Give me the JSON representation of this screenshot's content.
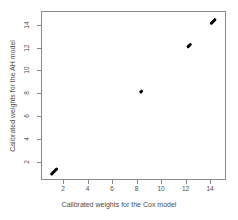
{
  "chart_data": {
    "type": "scatter",
    "title": "",
    "xlabel": "Calibrated weights for  the Cox model",
    "ylabel": "Calibrated weights for the AH model",
    "xlim": [
      0.2,
      15.3
    ],
    "ylim": [
      0.4,
      15.2
    ],
    "xticks": [
      2,
      4,
      6,
      8,
      10,
      12,
      14
    ],
    "yticks": [
      2,
      4,
      6,
      8,
      10,
      12,
      14
    ],
    "xticklabels": [
      "2",
      "4",
      "6",
      "8",
      "10",
      "12",
      "14"
    ],
    "yticklabels": [
      "2",
      "4",
      "6",
      "8",
      "10",
      "12",
      "14"
    ],
    "grid": false,
    "legend": false,
    "point_color": "#000000",
    "frame_color": "#8a8a8a",
    "text_color": "#4d4d4d",
    "background": "#ffffff",
    "series": [
      {
        "name": "calibrated weights",
        "marker": "filled-circle",
        "clusters": [
          {
            "label": "cluster-low",
            "x": 1.15,
            "y": 1.25,
            "x_span": 0.45,
            "y_span": 0.75,
            "angle_deg": 45
          },
          {
            "label": "cluster-mid",
            "x": 8.3,
            "y": 8.25,
            "x_span": 0.22,
            "y_span": 0.3,
            "angle_deg": 45
          },
          {
            "label": "cluster-high",
            "x": 12.2,
            "y": 12.3,
            "x_span": 0.3,
            "y_span": 0.45,
            "angle_deg": 45
          },
          {
            "label": "cluster-top",
            "x": 14.2,
            "y": 14.35,
            "x_span": 0.35,
            "y_span": 0.6,
            "angle_deg": 45
          }
        ]
      }
    ]
  }
}
